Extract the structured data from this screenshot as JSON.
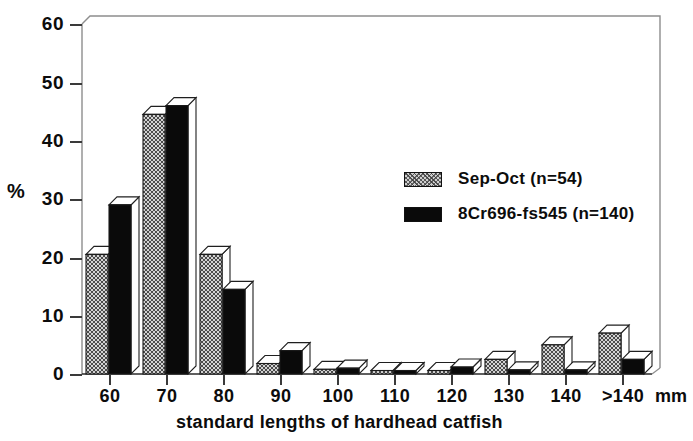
{
  "chart_data": {
    "type": "bar",
    "title": "",
    "subtitle": "",
    "xlabel": "standard lengths of hardhead catfish",
    "ylabel": "%",
    "x_unit": "mm",
    "ylim": [
      0,
      60
    ],
    "ytick_values": [
      0,
      10,
      20,
      30,
      40,
      50,
      60
    ],
    "ytick_labels": [
      "0",
      "10",
      "20",
      "30",
      "40",
      "50",
      "60"
    ],
    "grid": false,
    "legend_position": "upper-right-inside",
    "categories": [
      "60",
      "70",
      "80",
      "90",
      "100",
      "110",
      "120",
      "130",
      "140",
      ">140"
    ],
    "series": [
      {
        "name": "Sep-Oct (n=54)",
        "style": "hatched-gray",
        "color": "#cdcdcd",
        "values": [
          20.5,
          44.5,
          20.5,
          1.8,
          0.8,
          0.6,
          0.6,
          2.5,
          5.0,
          7.0
        ]
      },
      {
        "name": "8Cr696-fs545 (n=140)",
        "style": "solid-black",
        "color": "#0a0a0a",
        "values": [
          29.0,
          46.0,
          14.5,
          4.0,
          1.0,
          0.6,
          1.2,
          0.7,
          0.7,
          2.5
        ]
      }
    ]
  },
  "axes": {
    "y_label": "%",
    "y_ticks": [
      "60",
      "50",
      "40",
      "30",
      "20",
      "10",
      "0"
    ],
    "x_ticks": [
      "60",
      "70",
      "80",
      "90",
      "100",
      "110",
      "120",
      "130",
      "140",
      ">140"
    ],
    "x_unit_label": "mm",
    "x_title": "standard lengths of hardhead catfish"
  },
  "legend": {
    "entries": [
      {
        "label": "Sep-Oct (n=54)",
        "swatch": "hatched-gray-swatch"
      },
      {
        "label": "8Cr696-fs545 (n=140)",
        "swatch": "solid-black-swatch"
      }
    ]
  }
}
